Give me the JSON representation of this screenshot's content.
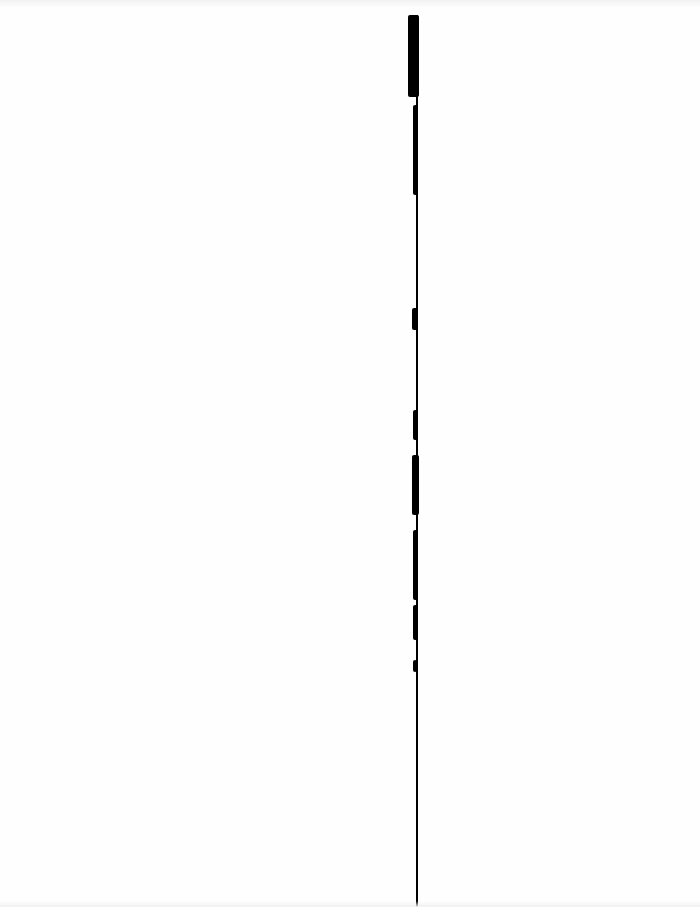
{
  "document": {
    "type": "blank scanned page",
    "text": "",
    "artifacts": [
      {
        "kind": "vertical-line",
        "x": 416,
        "y_start": 15,
        "y_end": 907,
        "color": "#000000"
      }
    ]
  }
}
